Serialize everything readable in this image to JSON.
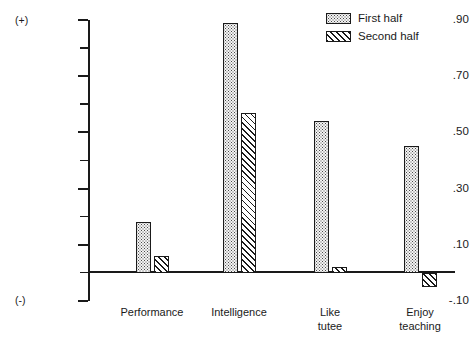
{
  "chart_data": {
    "type": "bar",
    "title": "",
    "xlabel": "",
    "ylabel": "",
    "categories": [
      "Performance",
      "Intelligence",
      "Like\ntutee",
      "Enjoy\nteaching"
    ],
    "series": [
      {
        "name": "First half",
        "pattern": "dots",
        "values": [
          0.18,
          0.89,
          0.54,
          0.45
        ]
      },
      {
        "name": "Second half",
        "pattern": "hatch",
        "values": [
          0.06,
          0.57,
          0.02,
          -0.05
        ]
      }
    ],
    "ylim": [
      -0.1,
      0.9
    ],
    "ytick_values": [
      0.9,
      0.8,
      0.7,
      0.6,
      0.5,
      0.4,
      0.3,
      0.2,
      0.1,
      0.0,
      -0.1
    ],
    "ytick_labels": [
      ".90",
      "",
      ".70",
      "",
      ".50",
      "",
      ".30",
      "",
      ".10",
      "",
      "-.10"
    ],
    "grid": false,
    "legend_position": "top-right",
    "axis_sign_top": "(+)",
    "axis_sign_bottom": "(-)"
  },
  "colors": {
    "ink": "#1a1a1a",
    "background": "#ffffff",
    "first_half_fill": "#f4f4f4",
    "second_half_fill": "#ffffff"
  }
}
